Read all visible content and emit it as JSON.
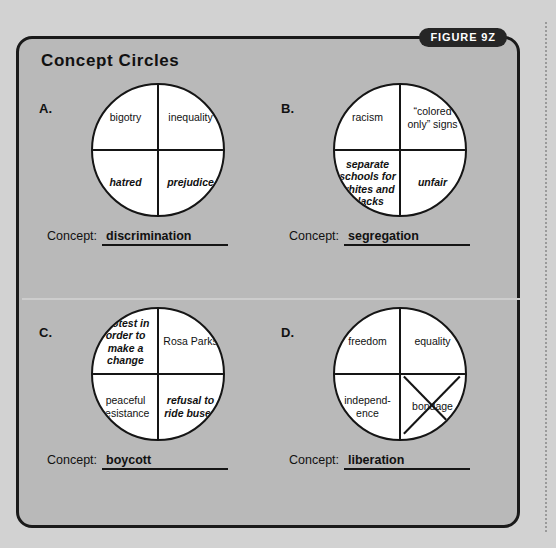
{
  "figure": {
    "badge": "FIGURE 9Z",
    "title": "Concept Circles",
    "concept_label": "Concept:",
    "colors": {
      "panel_background": "#b9b9b9",
      "page_background": "#d2d2d2",
      "ink": "#151515",
      "circle_fill": "#ffffff",
      "badge_background": "#262626",
      "badge_text": "#ffffff"
    }
  },
  "items": [
    {
      "letter": "A.",
      "quadrants": {
        "top_left": "bigotry",
        "top_right": "inequality",
        "bottom_left": "hatred",
        "bottom_right": "prejudice"
      },
      "italic_quadrants": [
        "bottom_left",
        "bottom_right"
      ],
      "crossed_out": null,
      "concept": "discrimination"
    },
    {
      "letter": "B.",
      "quadrants": {
        "top_left": "racism",
        "top_right": "“colored only” signs",
        "bottom_left": "separate schools for whites and blacks",
        "bottom_right": "unfair"
      },
      "italic_quadrants": [
        "bottom_left",
        "bottom_right"
      ],
      "crossed_out": null,
      "concept": "segregation"
    },
    {
      "letter": "C.",
      "quadrants": {
        "top_left": "protest in order to make a change",
        "top_right": "Rosa Parks",
        "bottom_left": "peaceful resistance",
        "bottom_right": "refusal to ride buses"
      },
      "italic_quadrants": [
        "top_left",
        "bottom_right"
      ],
      "crossed_out": null,
      "concept": "boycott"
    },
    {
      "letter": "D.",
      "quadrants": {
        "top_left": "freedom",
        "top_right": "equality",
        "bottom_left": "independ-\nence",
        "bottom_right": "bondage"
      },
      "italic_quadrants": [],
      "crossed_out": "bottom_right",
      "concept": "liberation"
    }
  ]
}
